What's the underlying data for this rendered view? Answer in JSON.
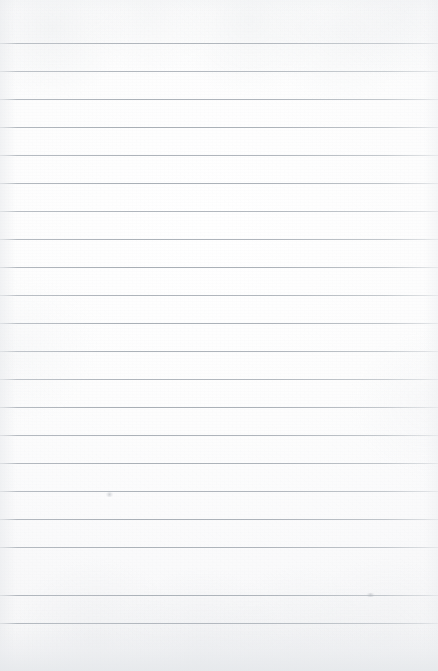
{
  "document": {
    "kind": "ruled-paper-scan",
    "description": "Blank lined notebook paper sheet, scanned",
    "width": 438,
    "height": 671,
    "has_text_content": false,
    "text_content": "",
    "paper_color": "#fbfbfc",
    "rule_line_color": "#a2a9b1",
    "bottom_band_color": "#e5e8eb"
  },
  "layout": {
    "first_line_y": 43,
    "line_spacing": 28,
    "line_count": 21,
    "line_thickness": 1,
    "left_margin": 0,
    "right_margin": 0,
    "top_margin": 43,
    "bottom_margin": 48,
    "has_vertical_margin_rule": false
  },
  "rule_lines": [
    {
      "index": 1,
      "y": 43,
      "opacity": 0.88
    },
    {
      "index": 2,
      "y": 71,
      "opacity": 0.8
    },
    {
      "index": 3,
      "y": 99,
      "opacity": 0.86
    },
    {
      "index": 4,
      "y": 127,
      "opacity": 0.9
    },
    {
      "index": 5,
      "y": 155,
      "opacity": 0.84
    },
    {
      "index": 6,
      "y": 183,
      "opacity": 0.88
    },
    {
      "index": 7,
      "y": 211,
      "opacity": 0.82
    },
    {
      "index": 8,
      "y": 239,
      "opacity": 0.86
    },
    {
      "index": 9,
      "y": 267,
      "opacity": 0.9
    },
    {
      "index": 10,
      "y": 295,
      "opacity": 0.84
    },
    {
      "index": 11,
      "y": 323,
      "opacity": 0.88
    },
    {
      "index": 12,
      "y": 351,
      "opacity": 0.86
    },
    {
      "index": 13,
      "y": 379,
      "opacity": 0.82
    },
    {
      "index": 14,
      "y": 407,
      "opacity": 0.9
    },
    {
      "index": 15,
      "y": 435,
      "opacity": 0.86
    },
    {
      "index": 16,
      "y": 463,
      "opacity": 0.88
    },
    {
      "index": 17,
      "y": 491,
      "opacity": 0.84
    },
    {
      "index": 18,
      "y": 519,
      "opacity": 0.88
    },
    {
      "index": 19,
      "y": 547,
      "opacity": 0.86
    },
    {
      "index": 20,
      "y": 595,
      "opacity": 0.9
    },
    {
      "index": 21,
      "y": 623,
      "opacity": 0.88
    }
  ],
  "artifacts": [
    {
      "name": "smudge-upper-left",
      "x": 105,
      "y": 492,
      "w": 9,
      "h": 5
    },
    {
      "name": "smudge-lower-right",
      "x": 365,
      "y": 593,
      "w": 11,
      "h": 4
    }
  ]
}
